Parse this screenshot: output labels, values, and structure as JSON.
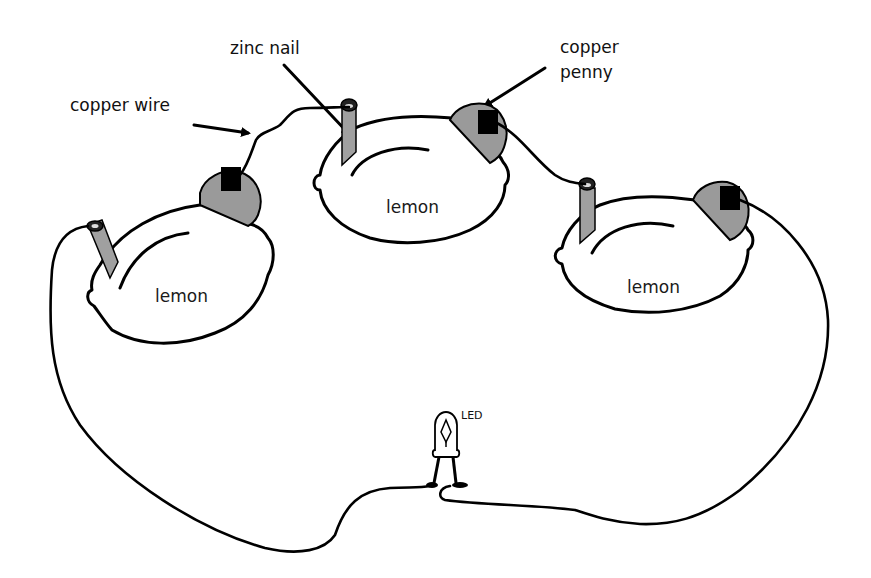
{
  "diagram": {
    "labels": {
      "copper_wire": "copper wire",
      "zinc_nail": "zinc nail",
      "copper_penny_line1": "copper",
      "copper_penny_line2": "penny",
      "led": "LED"
    },
    "lemons": [
      {
        "label": "lemon",
        "position": "left"
      },
      {
        "label": "lemon",
        "position": "center"
      },
      {
        "label": "lemon",
        "position": "right"
      }
    ],
    "components": {
      "electrodes": [
        "zinc nail",
        "copper penny"
      ],
      "load": "LED",
      "connector": "copper wire",
      "cell_count": 3
    },
    "colors": {
      "outline": "#000000",
      "metal_fill": "#9a9a9a",
      "background": "#ffffff"
    }
  }
}
